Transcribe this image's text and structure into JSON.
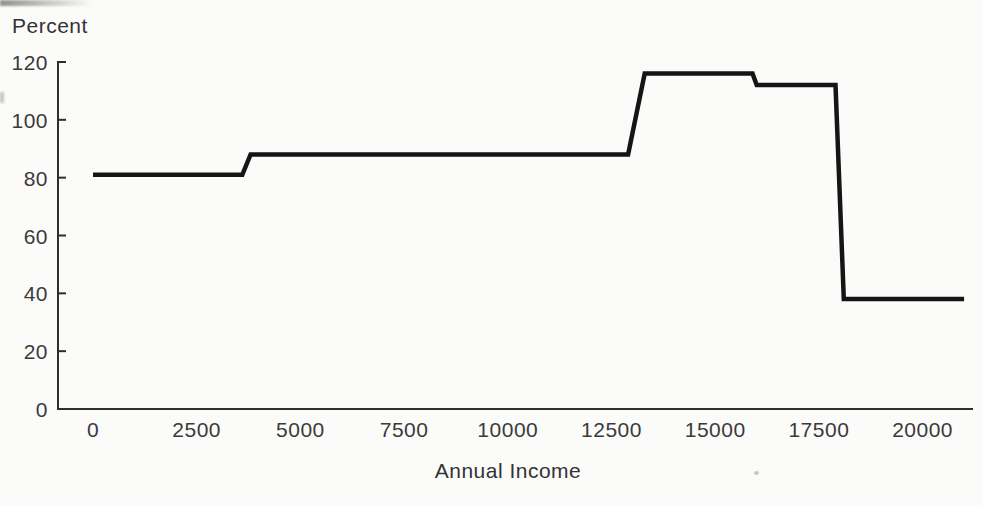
{
  "figure": {
    "ylabel": "Percent",
    "xlabel": "Annual Income"
  },
  "colors": {
    "background": "#fbfbf9",
    "axis": "#2e2e2e",
    "text": "#3a3a3a",
    "line": "#151515"
  },
  "chart_data": {
    "type": "line",
    "title": "",
    "xlabel": "Annual Income",
    "ylabel": "Percent",
    "xlim": [
      0,
      21200
    ],
    "ylim": [
      0,
      120
    ],
    "x_ticks": [
      0,
      2500,
      5000,
      7500,
      10000,
      12500,
      15000,
      17500,
      20000
    ],
    "y_ticks": [
      0,
      20,
      40,
      60,
      80,
      100,
      120
    ],
    "grid": false,
    "legend": false,
    "series": [
      {
        "name": "percent",
        "points": [
          [
            0,
            81
          ],
          [
            3600,
            81
          ],
          [
            3800,
            88
          ],
          [
            12900,
            88
          ],
          [
            13300,
            116
          ],
          [
            15900,
            116
          ],
          [
            16000,
            112
          ],
          [
            17900,
            112
          ],
          [
            18100,
            38
          ],
          [
            21000,
            38
          ]
        ]
      }
    ]
  }
}
